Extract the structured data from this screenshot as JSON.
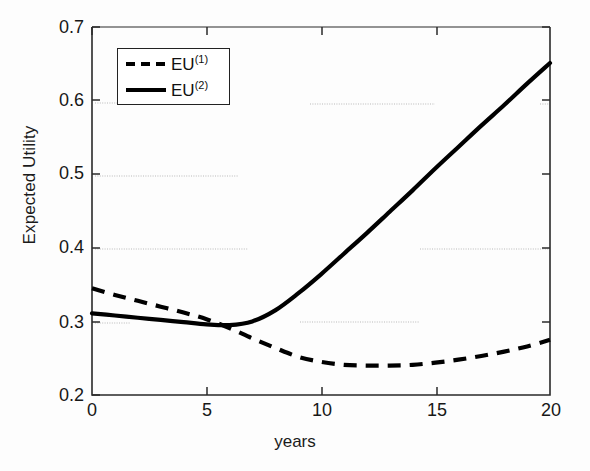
{
  "chart_data": {
    "type": "line",
    "title": "",
    "xlabel": "years",
    "ylabel": "Expected Utility",
    "xlim": [
      0,
      20
    ],
    "ylim": [
      0.2,
      0.7
    ],
    "xticks": [
      "0",
      "5",
      "10",
      "15",
      "20"
    ],
    "xtick_values": [
      0,
      5,
      10,
      15,
      20
    ],
    "yticks": [
      "0.7",
      "0.6",
      "0.5",
      "0.4",
      "0.3",
      "0.2"
    ],
    "ytick_values": [
      0.7,
      0.6,
      0.5,
      0.4,
      0.3,
      0.2
    ],
    "grid": false,
    "legend_position": "upper left",
    "series": [
      {
        "name": "EU(1)",
        "label_base": "EU",
        "label_sup": "(1)",
        "style": "dashed",
        "color": "#000000",
        "x": [
          0,
          1,
          2,
          3,
          4,
          5,
          6,
          7,
          8,
          9,
          10,
          11,
          12,
          13,
          14,
          15,
          16,
          17,
          18,
          19,
          20
        ],
        "values": [
          0.345,
          0.336,
          0.328,
          0.32,
          0.312,
          0.303,
          0.291,
          0.277,
          0.264,
          0.252,
          0.245,
          0.241,
          0.24,
          0.24,
          0.241,
          0.244,
          0.248,
          0.253,
          0.259,
          0.266,
          0.275
        ]
      },
      {
        "name": "EU(2)",
        "label_base": "EU",
        "label_sup": "(2)",
        "style": "solid",
        "color": "#000000",
        "x": [
          0,
          1,
          2,
          3,
          4,
          5,
          6,
          7,
          8,
          9,
          10,
          11,
          12,
          13,
          14,
          15,
          16,
          17,
          18,
          19,
          20
        ],
        "values": [
          0.311,
          0.308,
          0.305,
          0.302,
          0.299,
          0.296,
          0.295,
          0.3,
          0.315,
          0.338,
          0.364,
          0.392,
          0.42,
          0.449,
          0.478,
          0.508,
          0.537,
          0.566,
          0.594,
          0.623,
          0.651
        ]
      }
    ]
  },
  "axes": {
    "ylabel": "Expected Utility",
    "xlabel": "years",
    "yticks": [
      "0.7",
      "0.6",
      "0.5",
      "0.4",
      "0.3",
      "0.2"
    ],
    "xticks": [
      "0",
      "5",
      "10",
      "15",
      "20"
    ]
  },
  "legend": {
    "entries": [
      {
        "base": "EU",
        "sup": "(1)",
        "style": "dashed"
      },
      {
        "base": "EU",
        "sup": "(2)",
        "style": "solid"
      }
    ]
  },
  "colors": {
    "line": "#000000",
    "axis": "#2a2a2a",
    "background": "#fdfdfd",
    "artifact": "#b9b9b9"
  }
}
